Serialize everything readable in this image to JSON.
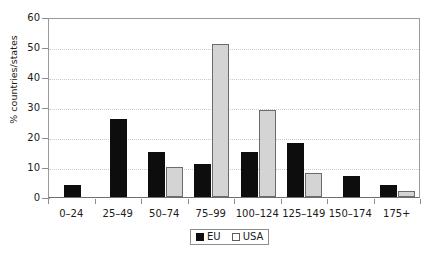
{
  "chart_data": {
    "type": "bar",
    "title": "",
    "xlabel": "",
    "ylabel": "% countries/states",
    "categories": [
      "0–24",
      "25–49",
      "50–74",
      "75–99",
      "100–124",
      "125–149",
      "150–174",
      "175+"
    ],
    "series": [
      {
        "name": "EU",
        "color": "#0d0d0d",
        "values": [
          4,
          26,
          15,
          11,
          15,
          18,
          7,
          4
        ]
      },
      {
        "name": "USA",
        "color": "#d4d4d4",
        "values": [
          0,
          0,
          10,
          51,
          29,
          8,
          0,
          2
        ]
      }
    ],
    "ylim": [
      0,
      60
    ],
    "yticks": [
      0,
      10,
      20,
      30,
      40,
      50,
      60
    ],
    "ytick_labels": [
      "0",
      "10",
      "20",
      "30",
      "40",
      "50",
      "60"
    ],
    "grid": "horizontal-dotted",
    "legend_position": "bottom-center"
  },
  "legend": {
    "entries": [
      {
        "label": "EU"
      },
      {
        "label": "USA"
      }
    ]
  }
}
